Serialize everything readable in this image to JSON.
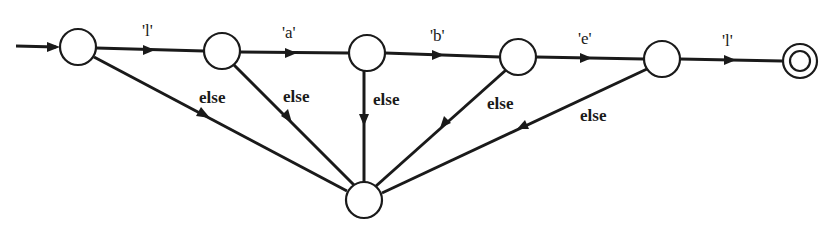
{
  "diagram": {
    "type": "finite-state-automaton",
    "nodes": [
      {
        "id": "s0",
        "kind": "start"
      },
      {
        "id": "s1",
        "kind": "state"
      },
      {
        "id": "s2",
        "kind": "state"
      },
      {
        "id": "s3",
        "kind": "state"
      },
      {
        "id": "s4",
        "kind": "state"
      },
      {
        "id": "accept",
        "kind": "accepting"
      },
      {
        "id": "fail",
        "kind": "state"
      }
    ],
    "edges": [
      {
        "from": "s0",
        "to": "s1",
        "label": "'l'"
      },
      {
        "from": "s1",
        "to": "s2",
        "label": "'a'"
      },
      {
        "from": "s2",
        "to": "s3",
        "label": "'b'"
      },
      {
        "from": "s3",
        "to": "s4",
        "label": "'e'"
      },
      {
        "from": "s4",
        "to": "accept",
        "label": "'l'"
      },
      {
        "from": "s0",
        "to": "fail",
        "label": "else"
      },
      {
        "from": "s1",
        "to": "fail",
        "label": "else"
      },
      {
        "from": "s2",
        "to": "fail",
        "label": "else"
      },
      {
        "from": "s3",
        "to": "fail",
        "label": "else"
      },
      {
        "from": "s4",
        "to": "fail",
        "label": "else"
      }
    ]
  }
}
